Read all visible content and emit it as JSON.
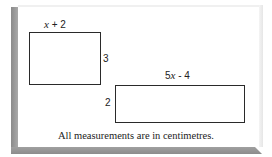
{
  "diagram": {
    "shapes": [
      {
        "type": "rectangle",
        "top_label_var": "x",
        "top_label_rest": " + 2",
        "side_label": "3"
      },
      {
        "type": "rectangle",
        "top_label_coef": "5",
        "top_label_var": "x",
        "top_label_rest": " - 4",
        "side_label": "2"
      }
    ],
    "caption": "All measurements are in centimetres."
  },
  "colors": {
    "frame": "#999999",
    "stroke": "#2a2a2a",
    "background": "#ffffff"
  }
}
